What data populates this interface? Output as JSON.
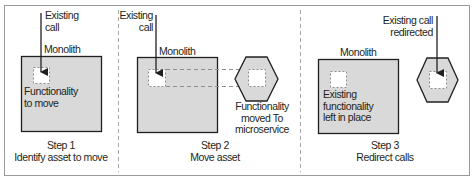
{
  "colors": {
    "frame": "#9a9a9a",
    "divider": "#a8a8a8",
    "box_fill": "#d9d9d9",
    "box_stroke": "#231f20",
    "inner_fill": "#ffffff",
    "dash": "#8f8f8f",
    "arrow": "#231f20"
  },
  "step1": {
    "call_label_1": "Existing",
    "call_label_2": "call",
    "monolith": "Monolith",
    "func_label_1": "Functionality",
    "func_label_2": "to move",
    "step_title": "Step 1",
    "step_desc": "Identify asset to move"
  },
  "step2": {
    "call_label_1": "Existing",
    "call_label_2": "call",
    "monolith": "Monolith",
    "func_label_1": "Functionality",
    "func_label_2": "moved To",
    "func_label_3": "microservice",
    "step_title": "Step 2",
    "step_desc": "Move asset"
  },
  "step3": {
    "call_label_1": "Existing call",
    "call_label_2": "redirected",
    "monolith": "Monolith",
    "func_label_1": "Existing",
    "func_label_2": "functionality",
    "func_label_3": "left in place",
    "step_title": "Step 3",
    "step_desc": "Redirect calls"
  }
}
